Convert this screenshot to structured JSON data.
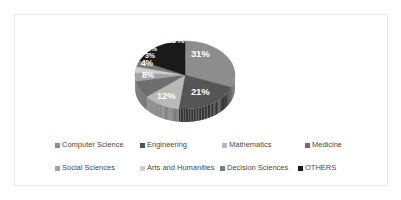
{
  "chart_data": {
    "type": "pie",
    "title": "",
    "subtitle": "",
    "xlabel": "",
    "ylabel": "",
    "grid": false,
    "legend_position": "bottom",
    "units": "percent",
    "total": 100,
    "categories": [
      "Computer Science",
      "Engineering",
      "Mathematics",
      "Medicine",
      "Social Sciences",
      "Arts and Humanities",
      "Decision Sciences",
      "OTHERS"
    ],
    "values": [
      31,
      21,
      12,
      8,
      4,
      3,
      3,
      18
    ],
    "data_labels": [
      "31%",
      "21%",
      "12%",
      "8%",
      "4%",
      "3%",
      "3%",
      "18%"
    ],
    "colors": [
      "#8d8d8d",
      "#555555",
      "#b9b9b9",
      "#6e6e6e",
      "#a3a3a3",
      "#cfcfcf",
      "#7a7a7a",
      "#1a1a1a"
    ],
    "slices": [
      {
        "label": "Computer Science",
        "value": 31,
        "data_label": "31%",
        "color": "#8d8d8d"
      },
      {
        "label": "Engineering",
        "value": 21,
        "data_label": "21%",
        "color": "#555555"
      },
      {
        "label": "Mathematics",
        "value": 12,
        "data_label": "12%",
        "color": "#b9b9b9"
      },
      {
        "label": "Medicine",
        "value": 8,
        "data_label": "8%",
        "color": "#6e6e6e"
      },
      {
        "label": "Social Sciences",
        "value": 4,
        "data_label": "4%",
        "color": "#a3a3a3"
      },
      {
        "label": "Arts and Humanities",
        "value": 3,
        "data_label": "3%",
        "color": "#cfcfcf"
      },
      {
        "label": "Decision Sciences",
        "value": 3,
        "data_label": "3%",
        "color": "#7a7a7a"
      },
      {
        "label": "OTHERS",
        "value": 18,
        "data_label": "18%",
        "color": "#1a1a1a"
      }
    ]
  },
  "labels": {
    "computer_science": "31%",
    "engineering": "21%",
    "mathematics": "12%",
    "medicine": "8%",
    "social_sciences": "4%",
    "arts_humanities": "3%",
    "decision_sciences": "3%",
    "others": "18%"
  },
  "legend": {
    "row1": [
      {
        "label": "Computer Science",
        "color": "#8d8d8d"
      },
      {
        "label": "Engineering",
        "color": "#555555"
      },
      {
        "label": "Mathematics",
        "color": "#b9b9b9"
      },
      {
        "label": "Medicine",
        "color": "#6e6e6e"
      }
    ],
    "row2": [
      {
        "label": "Social Sciences",
        "color": "#a3a3a3"
      },
      {
        "label": "Arts and Humanities",
        "color": "#cfcfcf"
      },
      {
        "label": "Decision Sciences",
        "color": "#7a7a7a"
      },
      {
        "label": "OTHERS",
        "color": "#1a1a1a"
      }
    ]
  },
  "style": {
    "frame_border_color": "#e8e8e8",
    "background": "#ffffff",
    "label_text_color": "#ffffff",
    "legend_text_color": "#4a4a4a"
  }
}
